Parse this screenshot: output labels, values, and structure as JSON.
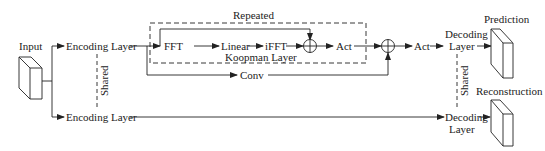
{
  "diagram": {
    "input_label": "Input",
    "encoding_top": "Encoding Layer",
    "encoding_bottom": "Encoding Layer",
    "shared_left": "Shared",
    "repeated_label": "Repeated",
    "koopman_label": "Koopman Layer",
    "fft": "FFT",
    "linear": "Linear",
    "ifft": "iFFT",
    "act_inner": "Act",
    "conv": "Conv",
    "act_outer": "Act",
    "decoding_top_1": "Decoding",
    "decoding_top_2": "Layer",
    "decoding_bottom_1": "Decoding",
    "decoding_bottom_2": "Layer",
    "shared_right": "Shared",
    "prediction": "Prediction",
    "reconstruction": "Reconstruction"
  },
  "colors": {
    "line": "#222222",
    "background": "#ffffff"
  }
}
